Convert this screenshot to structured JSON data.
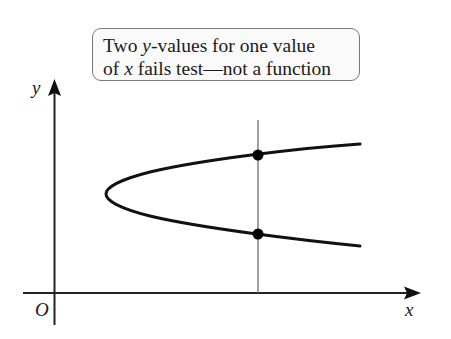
{
  "callout": {
    "line1_prefix": "Two ",
    "line1_var": "y",
    "line1_suffix": "-values for one value",
    "line2_prefix": "of ",
    "line2_var": "x",
    "line2_suffix": " fails test—not a function"
  },
  "axes": {
    "y_label": "y",
    "x_label": "x",
    "origin_label": "O"
  },
  "colors": {
    "curve": "#111111",
    "axis": "#222222",
    "test_line": "#6e6e6e",
    "callout_border": "#7a7a7a",
    "callout_fill": "#fafafa",
    "points": "#000000"
  },
  "diagram": {
    "vertical_test_line_x_px": 258,
    "intersection_points_px": [
      {
        "x": 258,
        "y": 155
      },
      {
        "x": 258,
        "y": 234
      }
    ]
  }
}
